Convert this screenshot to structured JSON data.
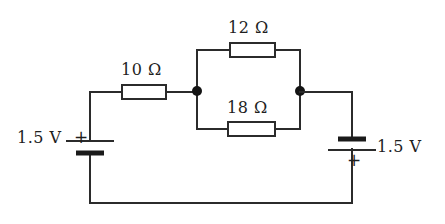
{
  "diagram": {
    "type": "electrical-schematic",
    "canvas": {
      "width": 445,
      "height": 224,
      "background": "#ffffff",
      "stroke": "#2b2b2b"
    }
  },
  "components": {
    "resistors": [
      {
        "id": "r-10",
        "label": "10 Ω",
        "value": 10,
        "unit": "Ω",
        "position": "series-top-left"
      },
      {
        "id": "r-12",
        "label": "12 Ω",
        "value": 12,
        "unit": "Ω",
        "position": "parallel-upper-branch"
      },
      {
        "id": "r-18",
        "label": "18 Ω",
        "value": 18,
        "unit": "Ω",
        "position": "parallel-lower-branch"
      }
    ],
    "batteries": [
      {
        "id": "battery-left",
        "label": "1.5 V",
        "value": 1.5,
        "unit": "V",
        "terminal_marker": "+",
        "terminal_side": "top",
        "position": "left-branch"
      },
      {
        "id": "battery-right",
        "label": "1.5 V",
        "value": 1.5,
        "unit": "V",
        "terminal_marker": "+",
        "terminal_side": "bottom",
        "position": "right-branch"
      }
    ],
    "junctions": [
      {
        "id": "node-left",
        "x": 197,
        "y": 90
      },
      {
        "id": "node-right",
        "x": 300,
        "y": 90
      }
    ]
  },
  "labels": {
    "r10": "10 Ω",
    "r12": "12 Ω",
    "r18": "18 Ω",
    "left_battery_voltage": "1.5 V",
    "left_battery_plus": "+",
    "right_battery_voltage": "1.5 V",
    "right_battery_plus": "+"
  }
}
